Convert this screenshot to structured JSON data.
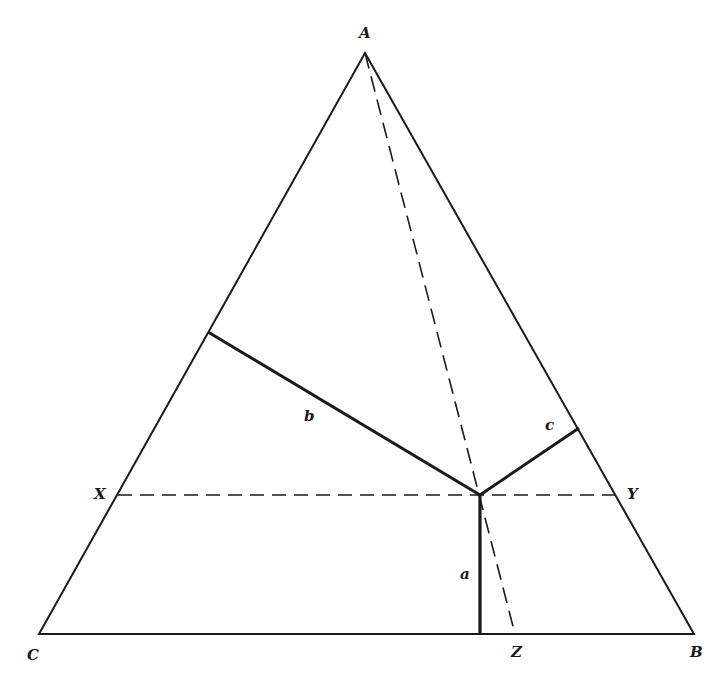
{
  "diagram": {
    "type": "ternary-triangle",
    "vertices": {
      "A": {
        "label": "A",
        "x": 365,
        "y": 53
      },
      "B": {
        "label": "B",
        "x": 694,
        "y": 634
      },
      "C": {
        "label": "C",
        "x": 39,
        "y": 634
      }
    },
    "point_P": {
      "x": 480,
      "y": 495
    },
    "side_points": {
      "X": {
        "label": "X",
        "x": 118,
        "y": 495
      },
      "Y": {
        "label": "Y",
        "x": 615,
        "y": 495
      },
      "Z": {
        "label": "Z",
        "x": 515,
        "y": 634
      }
    },
    "perpendiculars": {
      "a": {
        "label": "a",
        "from": [
          480,
          495
        ],
        "to": [
          480,
          634
        ]
      },
      "b": {
        "label": "b",
        "from": [
          480,
          495
        ],
        "to": [
          208,
          332
        ]
      },
      "c": {
        "label": "c",
        "from": [
          480,
          495
        ],
        "to": [
          579,
          428
        ]
      }
    },
    "dashed_lines": [
      {
        "name": "X-Y",
        "from": [
          118,
          495
        ],
        "to": [
          615,
          495
        ]
      },
      {
        "name": "A-Z",
        "from": [
          365,
          53
        ],
        "to": [
          515,
          634
        ]
      }
    ],
    "colors": {
      "stroke": "#1a1a1a",
      "background": "#ffffff"
    }
  },
  "labels": {
    "A": "A",
    "B": "B",
    "C": "C",
    "X": "X",
    "Y": "Y",
    "Z": "Z",
    "a": "a",
    "b": "b",
    "c": "c"
  }
}
